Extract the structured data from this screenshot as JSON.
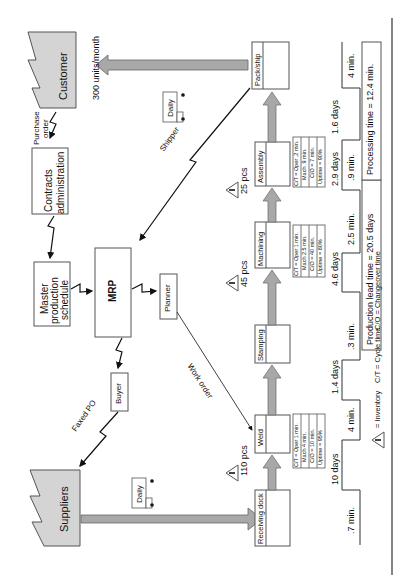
{
  "orientation": "rotated 90 degrees counter-clockwise",
  "external": {
    "customer": {
      "label": "Customer",
      "demand": "300 units/month"
    },
    "suppliers": {
      "label": "Suppliers"
    }
  },
  "control": {
    "contracts_admin": "Contracts administration",
    "contracts_admin_line1": "Contracts",
    "contracts_admin_line2": "administration",
    "mps_line1": "Master",
    "mps_line2": "production",
    "mps_line3": "schedule",
    "mrp": "MRP",
    "planner": "Planner",
    "buyer": "Buyer"
  },
  "flows": {
    "purchase_order_line1": "Purchase",
    "purchase_order_line2": "order",
    "faxed_po": "Faxed PO",
    "shipper": "Shipper",
    "work_order": "Work order",
    "daily_customer": "Daily",
    "daily_supplier": "Daily"
  },
  "processes": [
    {
      "name": "Receiving dock"
    },
    {
      "name": "Weld",
      "data": [
        "C/T = Oper 1 min.",
        "Mach 4 min.",
        "C/O = 10 min.",
        "Uptime = 95%"
      ]
    },
    {
      "name": "Stamping"
    },
    {
      "name": "Machining",
      "data": [
        "C/T = Oper 1 min.",
        "Mach 2.5 min.",
        "C/O = 40 min.",
        "Uptime = 80%"
      ]
    },
    {
      "name": "Assembly",
      "data": [
        "C/T = Oper .2 min.",
        "Mach .9 min.",
        "C/O = 7 min.",
        "Uptime = 90%"
      ]
    },
    {
      "name": "Pack/ship"
    }
  ],
  "inventory": [
    {
      "symbol": "I",
      "qty": "110 pcs"
    },
    {
      "symbol": "I",
      "qty": "45 pcs"
    },
    {
      "symbol": "I",
      "qty": "25 pcs"
    }
  ],
  "timeline": {
    "days": [
      "10 days",
      "1.4 days",
      "4.6 days",
      "2.9 days",
      "1.6 days"
    ],
    "minutes": [
      ".7 min.",
      "4 min.",
      ".3 min.",
      "2.5 min.",
      ".9 min.",
      "4 min."
    ],
    "production_lead_time": "Production lead time = 20.5 days",
    "processing_time": "Processing time = 12.4 min."
  },
  "legend": {
    "inventory_symbol": "I",
    "inventory": "= Inventory",
    "cycle_time": "C/T = Cycle time",
    "changeover": "C/O = Changeover time"
  }
}
